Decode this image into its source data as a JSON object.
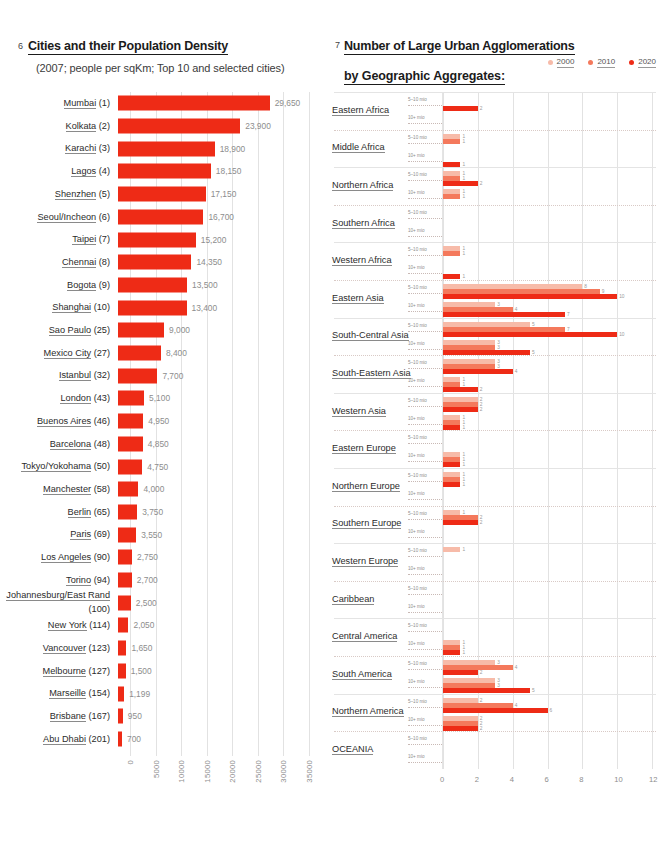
{
  "left_panel": {
    "number": "6",
    "title": "Cities and their Population Density",
    "subtitle": "(2007; people per sqKm; Top 10 and selected cities)"
  },
  "right_panel": {
    "number": "7",
    "title": "Number of Large Urban Agglomerations",
    "subtitle": "by Geographic Aggregates:",
    "legend": [
      {
        "label": "2000",
        "color": "#f7bba9"
      },
      {
        "label": "2010",
        "color": "#f4795c"
      },
      {
        "label": "2020",
        "color": "#ee2b16"
      }
    ],
    "sub_row_labels": {
      "small": "5–10 mio",
      "large": "10+ mio"
    }
  },
  "chart_data": [
    {
      "type": "bar",
      "id": "city-density",
      "title": "Cities and their Population Density",
      "subtitle": "(2007; people per sqKm; Top 10 and selected cities)",
      "orientation": "horizontal",
      "xlabel": "",
      "ylabel": "",
      "xlim": [
        0,
        35000
      ],
      "xticks": [
        "0",
        "5000",
        "10000",
        "15000",
        "20000",
        "25000",
        "30000",
        "35000"
      ],
      "grid": true,
      "bar_color": "#ee2b16",
      "categories": [
        "Mumbai (1)",
        "Kolkata (2)",
        "Karachi (3)",
        "Lagos (4)",
        "Shenzhen (5)",
        "Seoul/Incheon (6)",
        "Taipei (7)",
        "Chennai (8)",
        "Bogota (9)",
        "Shanghai (10)",
        "Sao Paulo (25)",
        "Mexico City (27)",
        "Istanbul (32)",
        "London (43)",
        "Buenos Aires (46)",
        "Barcelona (48)",
        "Tokyo/Yokohama (50)",
        "Manchester (58)",
        "Berlin (65)",
        "Paris (69)",
        "Los Angeles (90)",
        "Torino (94)",
        "Johannesburg/East Rand (100)",
        "New York (114)",
        "Vancouver (123)",
        "Melbourne (127)",
        "Marseille (154)",
        "Brisbane (167)",
        "Abu Dhabi (201)"
      ],
      "values": [
        29650,
        23900,
        18900,
        18150,
        17150,
        16700,
        15200,
        14350,
        13500,
        13400,
        9000,
        8400,
        7700,
        5100,
        4950,
        4850,
        4750,
        4000,
        3750,
        3550,
        2750,
        2700,
        2500,
        2050,
        1650,
        1500,
        1199,
        950,
        700
      ],
      "value_labels": [
        "29,650",
        "23,900",
        "18,900",
        "18,150",
        "17,150",
        "16,700",
        "15,200",
        "14,350",
        "13,500",
        "13,400",
        "9,000",
        "8,400",
        "7,700",
        "5,100",
        "4,950",
        "4,850",
        "4,750",
        "4,000",
        "3,750",
        "3,550",
        "2,750",
        "2,700",
        "2,500",
        "2,050",
        "1,650",
        "1,500",
        "1,199",
        "950",
        "700"
      ]
    },
    {
      "type": "bar",
      "id": "urban-agglomerations",
      "title": "Number of Large Urban Agglomerations by Geographic Aggregates",
      "orientation": "horizontal",
      "xlim": [
        0,
        12
      ],
      "xticks": [
        "0",
        "2",
        "4",
        "6",
        "8",
        "10",
        "12"
      ],
      "grid": true,
      "series": [
        {
          "name": "2000",
          "color": "#f7bba9"
        },
        {
          "name": "2010",
          "color": "#f4795c"
        },
        {
          "name": "2020",
          "color": "#ee2b16"
        }
      ],
      "regions": [
        {
          "name": "Eastern Africa",
          "small": [
            0,
            0,
            2
          ],
          "large": [
            0,
            0,
            0
          ]
        },
        {
          "name": "Middle Africa",
          "small": [
            1,
            1,
            0
          ],
          "large": [
            0,
            0,
            1
          ]
        },
        {
          "name": "Northern Africa",
          "small": [
            1,
            1,
            2
          ],
          "large": [
            1,
            1,
            0
          ]
        },
        {
          "name": "Southern Africa",
          "small": [
            0,
            0,
            0
          ],
          "large": [
            0,
            0,
            0
          ]
        },
        {
          "name": "Western Africa",
          "small": [
            1,
            1,
            0
          ],
          "large": [
            0,
            0,
            1
          ]
        },
        {
          "name": "Eastern Asia",
          "small": [
            8,
            9,
            10
          ],
          "large": [
            3,
            4,
            7
          ]
        },
        {
          "name": "South-Central Asia",
          "small": [
            5,
            7,
            10
          ],
          "large": [
            3,
            3,
            5
          ]
        },
        {
          "name": "South-Eastern Asia",
          "small": [
            3,
            3,
            4
          ],
          "large": [
            1,
            1,
            2
          ]
        },
        {
          "name": "Western Asia",
          "small": [
            2,
            2,
            2
          ],
          "large": [
            1,
            1,
            1
          ]
        },
        {
          "name": "Eastern Europe",
          "small": [
            0,
            0,
            0
          ],
          "large": [
            1,
            1,
            1
          ]
        },
        {
          "name": "Northern Europe",
          "small": [
            1,
            1,
            1
          ],
          "large": [
            0,
            0,
            0
          ]
        },
        {
          "name": "Southern Europe",
          "small": [
            1,
            2,
            2
          ],
          "large": [
            0,
            0,
            0
          ]
        },
        {
          "name": "Western Europe",
          "small": [
            1,
            0,
            0
          ],
          "large": [
            0,
            0,
            0
          ]
        },
        {
          "name": "Caribbean",
          "small": [
            0,
            0,
            0
          ],
          "large": [
            0,
            0,
            0
          ]
        },
        {
          "name": "Central America",
          "small": [
            0,
            0,
            0
          ],
          "large": [
            1,
            1,
            1
          ]
        },
        {
          "name": "South America",
          "small": [
            3,
            4,
            2
          ],
          "large": [
            3,
            3,
            5
          ]
        },
        {
          "name": "Northern America",
          "small": [
            2,
            4,
            6
          ],
          "large": [
            2,
            2,
            2
          ]
        },
        {
          "name": "OCEANIA",
          "small": [
            0,
            0,
            0
          ],
          "large": [
            0,
            0,
            0
          ]
        }
      ]
    }
  ]
}
